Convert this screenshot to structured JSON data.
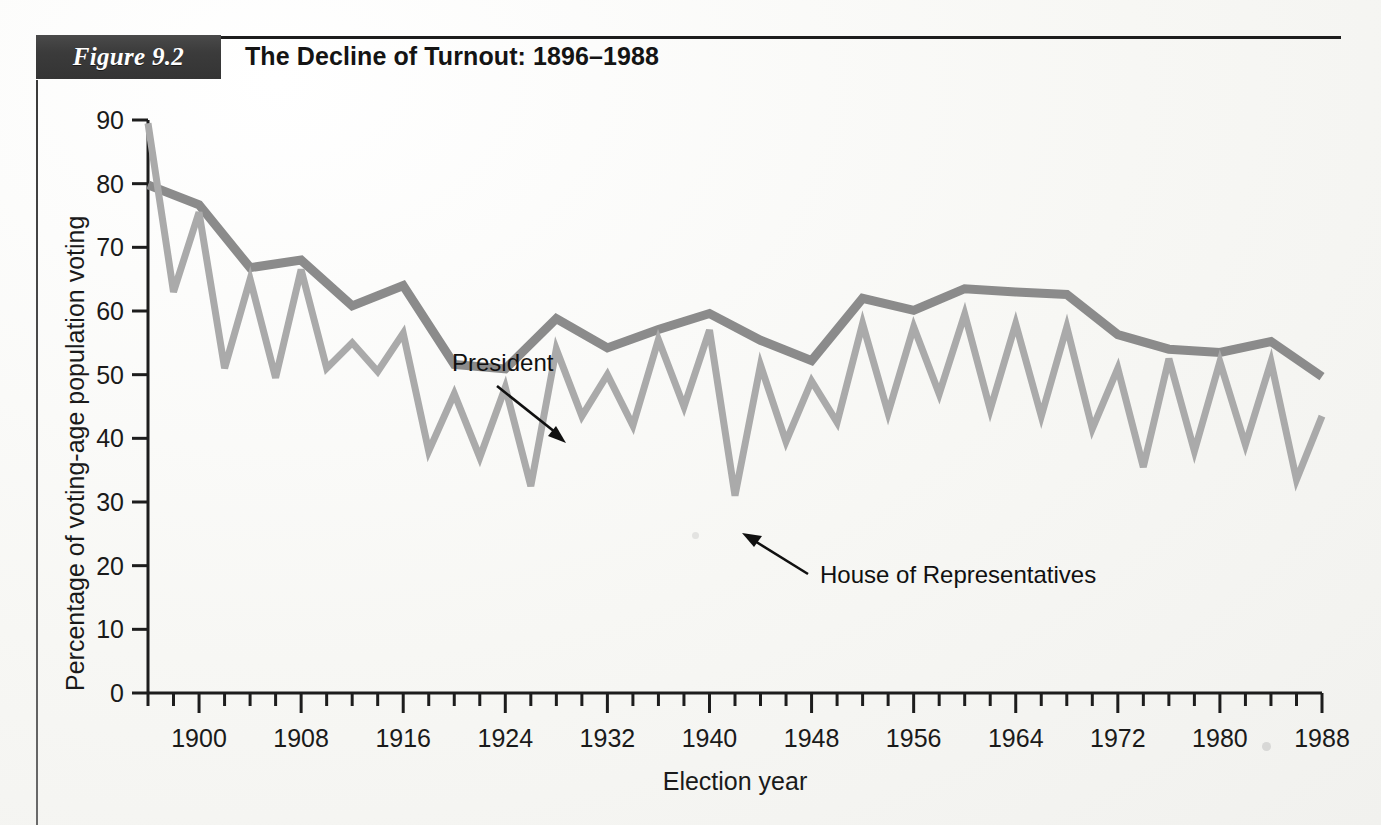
{
  "figure": {
    "badge_label": "Figure 9.2",
    "title": "The Decline of Turnout: 1896–1988"
  },
  "chart_data": {
    "type": "line",
    "title": "The Decline of Turnout: 1896–1988",
    "xlabel": "Election year",
    "ylabel": "Percentage of voting-age population voting",
    "xlim": [
      1896,
      1988
    ],
    "ylim": [
      0,
      90
    ],
    "yticks": [
      0,
      10,
      20,
      30,
      40,
      50,
      60,
      70,
      80,
      90
    ],
    "xticks_major": [
      1900,
      1908,
      1916,
      1924,
      1932,
      1940,
      1948,
      1956,
      1964,
      1972,
      1980,
      1988
    ],
    "xtick_minor_step": 2,
    "grid": false,
    "legend": "annotations",
    "annotations": [
      {
        "text": "President",
        "points_to_year": 1928,
        "points_to_value": 57
      },
      {
        "text": "House of Representatives",
        "points_to_year": 1942,
        "points_to_value": 33
      }
    ],
    "x": [
      1896,
      1898,
      1900,
      1902,
      1904,
      1906,
      1908,
      1910,
      1912,
      1914,
      1916,
      1918,
      1920,
      1922,
      1924,
      1926,
      1928,
      1930,
      1932,
      1934,
      1936,
      1938,
      1940,
      1942,
      1944,
      1946,
      1948,
      1950,
      1952,
      1954,
      1956,
      1958,
      1960,
      1962,
      1964,
      1966,
      1968,
      1970,
      1972,
      1974,
      1976,
      1978,
      1980,
      1982,
      1984,
      1986,
      1988
    ],
    "series": [
      {
        "name": "President",
        "color": "#8b8b8b",
        "x": [
          1896,
          1900,
          1904,
          1908,
          1912,
          1916,
          1920,
          1924,
          1928,
          1932,
          1936,
          1940,
          1944,
          1948,
          1952,
          1956,
          1960,
          1964,
          1968,
          1972,
          1976,
          1980,
          1984,
          1988
        ],
        "values": [
          79.8,
          76.7,
          66.8,
          68.0,
          60.8,
          64.0,
          51.6,
          50.9,
          58.8,
          54.2,
          57.1,
          59.6,
          55.4,
          52.2,
          62.0,
          60.1,
          63.5,
          63.0,
          62.6,
          56.3,
          54.0,
          53.5,
          55.2,
          49.7
        ]
      },
      {
        "name": "House of Representatives",
        "color": "#aaaaaa",
        "x": [
          1896,
          1898,
          1900,
          1902,
          1904,
          1906,
          1908,
          1910,
          1912,
          1914,
          1916,
          1918,
          1920,
          1922,
          1924,
          1926,
          1928,
          1930,
          1932,
          1934,
          1936,
          1938,
          1940,
          1942,
          1944,
          1946,
          1948,
          1950,
          1952,
          1954,
          1956,
          1958,
          1960,
          1962,
          1964,
          1966,
          1968,
          1970,
          1972,
          1974,
          1976,
          1978,
          1980,
          1982,
          1984,
          1986,
          1988
        ],
        "values": [
          89.5,
          63.0,
          75.5,
          51.0,
          65.0,
          49.5,
          66.5,
          51.0,
          55.0,
          50.5,
          56.5,
          38.0,
          47.0,
          37.0,
          48.0,
          32.5,
          54.0,
          43.5,
          50.0,
          42.0,
          55.5,
          45.0,
          57.0,
          31.0,
          51.5,
          39.5,
          49.0,
          42.5,
          58.0,
          44.0,
          57.5,
          47.0,
          59.5,
          44.5,
          58.0,
          43.5,
          57.5,
          41.5,
          51.0,
          35.5,
          52.5,
          38.0,
          52.0,
          39.0,
          52.0,
          33.5,
          43.5
        ]
      }
    ]
  }
}
